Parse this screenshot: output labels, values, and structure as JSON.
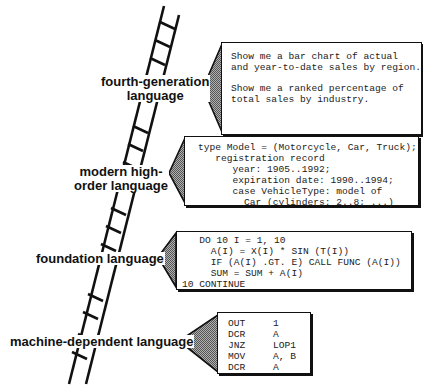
{
  "diagram": {
    "type": "language-level-ladder",
    "levels": [
      {
        "id": "fourth-generation",
        "label_lines": [
          "fourth-generation",
          "language"
        ],
        "example_kind": "natural-language queries",
        "example_paragraphs": [
          "Show me a bar chart of actual\nand year-to-date sales by region.",
          "Show me a ranked percentage of\ntotal sales by industry."
        ]
      },
      {
        "id": "modern-high-order",
        "label_lines": [
          "modern high-",
          "order language"
        ],
        "example_kind": "type declaration",
        "code": "type Model = (Motorcycle, Car, Truck);\n   registration record\n      year: 1905..1992;\n      expiration date: 1990..1994;\n      case VehicleType: model of\n        Car (cylinders: 2..8; ...)"
      },
      {
        "id": "foundation",
        "label_lines": [
          "foundation language"
        ],
        "example_kind": "FORTRAN loop",
        "code": "   DO 10 I = 1, 10\n     A(I) = X(I) * SIN (T(I))\n     IF (A(I) .GT. E) CALL FUNC (A(I))\n     SUM = SUM + A(I)\n10 CONTINUE"
      },
      {
        "id": "machine-dependent",
        "label_lines": [
          "machine-dependent language"
        ],
        "example_kind": "assembly",
        "asm": [
          {
            "op": "OUT",
            "arg": "1"
          },
          {
            "op": "DCR",
            "arg": "A"
          },
          {
            "op": "JNZ",
            "arg": "LOP1"
          },
          {
            "op": "MOV",
            "arg": "A, B"
          },
          {
            "op": "DCR",
            "arg": "A"
          }
        ]
      }
    ],
    "colors": {
      "ink": "#111111",
      "pointer_fill": "#8a8a8a",
      "box_fill": "#ffffff",
      "background": "#ffffff"
    }
  }
}
